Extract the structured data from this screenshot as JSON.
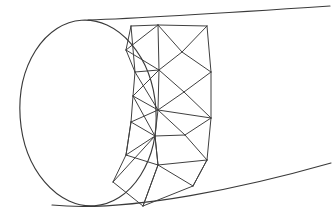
{
  "figure": {
    "description": "Line drawing of an open-ended tube or cylindrical duct seen in perspective. An ellipse forms the near open mouth at the left; two long slightly curved silhouette lines run off to the upper right and lower right. A band of triangular finite-element mesh wraps the tube just behind the mouth.",
    "background_color": "#ffffff",
    "line_color": "#3a3a3a",
    "mesh_line_color": "#404040",
    "line_width_px": 1,
    "width_px": 334,
    "height_px": 224
  },
  "geometry": {
    "mouth_ellipse": {
      "name": "open-end-ellipse",
      "center_x": 88,
      "center_y": 113,
      "radius_x": 68,
      "radius_y": 93,
      "rotation_deg": -4
    },
    "silhouette_top": {
      "name": "top-silhouette",
      "path": "M 88 20 C 150 18 240 12 330 6"
    },
    "silhouette_bottom": {
      "name": "bottom-silhouette",
      "path": "M 52 205 C 130 213 250 186 331 163"
    },
    "far_rim": {
      "name": "far-rim-curve",
      "path": "M 207 26 C 213 70 212 120 203 171"
    },
    "near_rim_inner": {
      "name": "mesh-near-boundary",
      "path": "M 129 26 C 140 80 140 150 129 208"
    }
  },
  "mesh": {
    "name": "triangular-surface-mesh",
    "type": "triangulated-band",
    "node_count": 23,
    "nodes": [
      {
        "id": "n0",
        "x": 131,
        "y": 26
      },
      {
        "id": "n1",
        "x": 158,
        "y": 25
      },
      {
        "id": "n2",
        "x": 207,
        "y": 26
      },
      {
        "id": "n3",
        "x": 126,
        "y": 50
      },
      {
        "id": "n4",
        "x": 182,
        "y": 52
      },
      {
        "id": "n5",
        "x": 135,
        "y": 72
      },
      {
        "id": "n6",
        "x": 211,
        "y": 72
      },
      {
        "id": "n7",
        "x": 159,
        "y": 70
      },
      {
        "id": "n8",
        "x": 133,
        "y": 96
      },
      {
        "id": "n9",
        "x": 184,
        "y": 92
      },
      {
        "id": "n10",
        "x": 211,
        "y": 118
      },
      {
        "id": "n11",
        "x": 158,
        "y": 110
      },
      {
        "id": "n12",
        "x": 131,
        "y": 122
      },
      {
        "id": "n13",
        "x": 185,
        "y": 135
      },
      {
        "id": "n14",
        "x": 155,
        "y": 136
      },
      {
        "id": "n15",
        "x": 126,
        "y": 155
      },
      {
        "id": "n16",
        "x": 207,
        "y": 160
      },
      {
        "id": "n17",
        "x": 158,
        "y": 165
      },
      {
        "id": "n18",
        "x": 113,
        "y": 182
      },
      {
        "id": "n19",
        "x": 193,
        "y": 186
      },
      {
        "id": "n20",
        "x": 143,
        "y": 206
      },
      {
        "id": "n21",
        "x": 146,
        "y": 26
      },
      {
        "id": "n22",
        "x": 171,
        "y": 26
      }
    ],
    "edges": [
      {
        "name": "top-boundary-1",
        "x1": 131,
        "y1": 26,
        "x2": 158,
        "y2": 25
      },
      {
        "name": "top-boundary-2",
        "x1": 158,
        "y1": 25,
        "x2": 207,
        "y2": 26
      },
      {
        "name": "left-col-a",
        "x1": 131,
        "y1": 26,
        "x2": 135,
        "y2": 72
      },
      {
        "name": "left-col-b",
        "x1": 135,
        "y1": 72,
        "x2": 133,
        "y2": 96
      },
      {
        "name": "left-col-c",
        "x1": 133,
        "y1": 96,
        "x2": 131,
        "y2": 122
      },
      {
        "name": "left-col-d",
        "x1": 131,
        "y1": 122,
        "x2": 126,
        "y2": 155
      },
      {
        "name": "left-col-e",
        "x1": 126,
        "y1": 155,
        "x2": 113,
        "y2": 182
      },
      {
        "name": "mid-col-a",
        "x1": 158,
        "y1": 25,
        "x2": 159,
        "y2": 70
      },
      {
        "name": "mid-col-b",
        "x1": 159,
        "y1": 70,
        "x2": 158,
        "y2": 110
      },
      {
        "name": "mid-col-c",
        "x1": 158,
        "y1": 110,
        "x2": 155,
        "y2": 136
      },
      {
        "name": "mid-col-d",
        "x1": 155,
        "y1": 136,
        "x2": 158,
        "y2": 165
      },
      {
        "name": "mid-col-e",
        "x1": 158,
        "y1": 165,
        "x2": 143,
        "y2": 206
      },
      {
        "name": "right-col-a",
        "x1": 207,
        "y1": 26,
        "x2": 211,
        "y2": 72
      },
      {
        "name": "right-col-b",
        "x1": 211,
        "y1": 72,
        "x2": 211,
        "y2": 118
      },
      {
        "name": "right-col-c",
        "x1": 211,
        "y1": 118,
        "x2": 207,
        "y2": 160
      },
      {
        "name": "right-col-d",
        "x1": 207,
        "y1": 160,
        "x2": 193,
        "y2": 186
      },
      {
        "name": "diag-1",
        "x1": 131,
        "y1": 26,
        "x2": 126,
        "y2": 50
      },
      {
        "name": "diag-2",
        "x1": 126,
        "y1": 50,
        "x2": 135,
        "y2": 72
      },
      {
        "name": "diag-3",
        "x1": 158,
        "y1": 25,
        "x2": 126,
        "y2": 50
      },
      {
        "name": "diag-4",
        "x1": 126,
        "y1": 50,
        "x2": 159,
        "y2": 70
      },
      {
        "name": "diag-5",
        "x1": 158,
        "y1": 25,
        "x2": 182,
        "y2": 52
      },
      {
        "name": "diag-6",
        "x1": 182,
        "y1": 52,
        "x2": 207,
        "y2": 26
      },
      {
        "name": "diag-7",
        "x1": 182,
        "y1": 52,
        "x2": 159,
        "y2": 70
      },
      {
        "name": "diag-8",
        "x1": 182,
        "y1": 52,
        "x2": 211,
        "y2": 72
      },
      {
        "name": "diag-9",
        "x1": 135,
        "y1": 72,
        "x2": 159,
        "y2": 70
      },
      {
        "name": "diag-10",
        "x1": 135,
        "y1": 72,
        "x2": 158,
        "y2": 110
      },
      {
        "name": "diag-11",
        "x1": 159,
        "y1": 70,
        "x2": 133,
        "y2": 96
      },
      {
        "name": "diag-12",
        "x1": 133,
        "y1": 96,
        "x2": 158,
        "y2": 110
      },
      {
        "name": "diag-13",
        "x1": 159,
        "y1": 70,
        "x2": 184,
        "y2": 92
      },
      {
        "name": "diag-14",
        "x1": 184,
        "y1": 92,
        "x2": 211,
        "y2": 72
      },
      {
        "name": "diag-15",
        "x1": 184,
        "y1": 92,
        "x2": 158,
        "y2": 110
      },
      {
        "name": "diag-16",
        "x1": 184,
        "y1": 92,
        "x2": 211,
        "y2": 118
      },
      {
        "name": "diag-17",
        "x1": 158,
        "y1": 110,
        "x2": 211,
        "y2": 118
      },
      {
        "name": "diag-18",
        "x1": 158,
        "y1": 110,
        "x2": 131,
        "y2": 122
      },
      {
        "name": "diag-19",
        "x1": 131,
        "y1": 122,
        "x2": 155,
        "y2": 136
      },
      {
        "name": "diag-20",
        "x1": 158,
        "y1": 110,
        "x2": 185,
        "y2": 135
      },
      {
        "name": "diag-21",
        "x1": 185,
        "y1": 135,
        "x2": 211,
        "y2": 118
      },
      {
        "name": "diag-22",
        "x1": 185,
        "y1": 135,
        "x2": 155,
        "y2": 136
      },
      {
        "name": "diag-23",
        "x1": 185,
        "y1": 135,
        "x2": 207,
        "y2": 160
      },
      {
        "name": "diag-24",
        "x1": 155,
        "y1": 136,
        "x2": 126,
        "y2": 155
      },
      {
        "name": "diag-25",
        "x1": 126,
        "y1": 155,
        "x2": 158,
        "y2": 165
      },
      {
        "name": "diag-26",
        "x1": 155,
        "y1": 136,
        "x2": 158,
        "y2": 165
      },
      {
        "name": "diag-27",
        "x1": 155,
        "y1": 136,
        "x2": 113,
        "y2": 182
      },
      {
        "name": "diag-28",
        "x1": 113,
        "y1": 182,
        "x2": 143,
        "y2": 206
      },
      {
        "name": "diag-29",
        "x1": 158,
        "y1": 165,
        "x2": 143,
        "y2": 206
      },
      {
        "name": "diag-30",
        "x1": 158,
        "y1": 165,
        "x2": 207,
        "y2": 160
      },
      {
        "name": "diag-31",
        "x1": 158,
        "y1": 165,
        "x2": 193,
        "y2": 186
      },
      {
        "name": "diag-32",
        "x1": 193,
        "y1": 186,
        "x2": 143,
        "y2": 206
      },
      {
        "name": "diag-33",
        "x1": 207,
        "y1": 160,
        "x2": 193,
        "y2": 186
      },
      {
        "name": "diag-34",
        "x1": 133,
        "y1": 96,
        "x2": 155,
        "y2": 136
      },
      {
        "name": "diag-35",
        "x1": 131,
        "y1": 122,
        "x2": 126,
        "y2": 155
      }
    ]
  }
}
